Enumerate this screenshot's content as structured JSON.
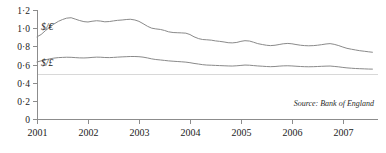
{
  "chart_data": {
    "type": "line",
    "title": "",
    "xlabel": "",
    "ylabel": "",
    "ylim": [
      0,
      1.2
    ],
    "xlim": [
      2001,
      2007.65
    ],
    "grid": "single horizontal gridline at 0.5",
    "legend_position": "inline labels at left of each series",
    "source": "Source: Bank of England",
    "y_ticks": [
      0,
      0.2,
      0.4,
      0.6,
      0.8,
      1.0,
      1.2
    ],
    "y_tick_labels": [
      "0",
      "0·2",
      "0·4",
      "0·6",
      "0·8",
      "1·0",
      "1·2"
    ],
    "x_ticks": [
      2001,
      2002,
      2003,
      2004,
      2005,
      2006,
      2007
    ],
    "x_tick_labels": [
      "2001",
      "2002",
      "2003",
      "2004",
      "2005",
      "2006",
      "2007"
    ],
    "gridlines_y": [
      0.5
    ],
    "series": [
      {
        "name": "$/€",
        "label": "$/€",
        "color": "#8a8a8a",
        "label_x": 2001.08,
        "label_y": 0.985,
        "x": [
          2001.0,
          2001.08,
          2001.17,
          2001.25,
          2001.33,
          2001.42,
          2001.5,
          2001.58,
          2001.67,
          2001.75,
          2001.83,
          2001.92,
          2002.0,
          2002.08,
          2002.17,
          2002.25,
          2002.33,
          2002.42,
          2002.5,
          2002.58,
          2002.67,
          2002.75,
          2002.83,
          2002.92,
          2003.0,
          2003.08,
          2003.17,
          2003.25,
          2003.33,
          2003.42,
          2003.5,
          2003.58,
          2003.67,
          2003.75,
          2003.83,
          2003.92,
          2004.0,
          2004.08,
          2004.17,
          2004.25,
          2004.33,
          2004.42,
          2004.5,
          2004.58,
          2004.67,
          2004.75,
          2004.83,
          2004.92,
          2005.0,
          2005.08,
          2005.17,
          2005.25,
          2005.33,
          2005.42,
          2005.5,
          2005.58,
          2005.67,
          2005.75,
          2005.83,
          2005.92,
          2006.0,
          2006.08,
          2006.17,
          2006.25,
          2006.33,
          2006.42,
          2006.5,
          2006.58,
          2006.67,
          2006.75,
          2006.83,
          2006.92,
          2007.0,
          2007.08,
          2007.17,
          2007.25,
          2007.33,
          2007.42,
          2007.5,
          2007.58
        ],
        "values": [
          0.905,
          0.93,
          0.975,
          1.01,
          1.045,
          1.075,
          1.095,
          1.11,
          1.115,
          1.1,
          1.085,
          1.072,
          1.068,
          1.076,
          1.082,
          1.078,
          1.07,
          1.073,
          1.08,
          1.086,
          1.09,
          1.095,
          1.098,
          1.09,
          1.075,
          1.05,
          1.02,
          1.0,
          0.992,
          0.986,
          0.975,
          0.96,
          0.952,
          0.95,
          0.948,
          0.945,
          0.93,
          0.905,
          0.885,
          0.875,
          0.872,
          0.868,
          0.86,
          0.855,
          0.848,
          0.84,
          0.838,
          0.843,
          0.855,
          0.862,
          0.858,
          0.845,
          0.83,
          0.82,
          0.812,
          0.808,
          0.812,
          0.82,
          0.828,
          0.832,
          0.828,
          0.82,
          0.812,
          0.808,
          0.806,
          0.808,
          0.812,
          0.818,
          0.826,
          0.83,
          0.822,
          0.808,
          0.792,
          0.778,
          0.768,
          0.76,
          0.752,
          0.746,
          0.74,
          0.735
        ]
      },
      {
        "name": "$/£",
        "label": "$/£",
        "color": "#8a8a8a",
        "label_x": 2001.08,
        "label_y": 0.585,
        "x": [
          2001.0,
          2001.08,
          2001.17,
          2001.25,
          2001.33,
          2001.42,
          2001.5,
          2001.58,
          2001.67,
          2001.75,
          2001.83,
          2001.92,
          2002.0,
          2002.08,
          2002.17,
          2002.25,
          2002.33,
          2002.42,
          2002.5,
          2002.58,
          2002.67,
          2002.75,
          2002.83,
          2002.92,
          2003.0,
          2003.08,
          2003.17,
          2003.25,
          2003.33,
          2003.42,
          2003.5,
          2003.58,
          2003.67,
          2003.75,
          2003.83,
          2003.92,
          2004.0,
          2004.08,
          2004.17,
          2004.25,
          2004.33,
          2004.42,
          2004.5,
          2004.58,
          2004.67,
          2004.75,
          2004.83,
          2004.92,
          2005.0,
          2005.08,
          2005.17,
          2005.25,
          2005.33,
          2005.42,
          2005.5,
          2005.58,
          2005.67,
          2005.75,
          2005.83,
          2005.92,
          2006.0,
          2006.08,
          2006.17,
          2006.25,
          2006.33,
          2006.42,
          2006.5,
          2006.58,
          2006.67,
          2006.75,
          2006.83,
          2006.92,
          2007.0,
          2007.08,
          2007.17,
          2007.25,
          2007.33,
          2007.42,
          2007.5,
          2007.58
        ],
        "values": [
          0.628,
          0.64,
          0.652,
          0.662,
          0.67,
          0.676,
          0.678,
          0.68,
          0.679,
          0.676,
          0.673,
          0.672,
          0.674,
          0.678,
          0.681,
          0.68,
          0.677,
          0.676,
          0.678,
          0.681,
          0.684,
          0.686,
          0.688,
          0.688,
          0.686,
          0.681,
          0.672,
          0.662,
          0.655,
          0.65,
          0.645,
          0.64,
          0.636,
          0.633,
          0.63,
          0.626,
          0.62,
          0.612,
          0.605,
          0.598,
          0.594,
          0.592,
          0.59,
          0.588,
          0.586,
          0.584,
          0.583,
          0.586,
          0.59,
          0.594,
          0.592,
          0.588,
          0.584,
          0.581,
          0.578,
          0.576,
          0.578,
          0.582,
          0.585,
          0.586,
          0.584,
          0.581,
          0.578,
          0.576,
          0.575,
          0.576,
          0.578,
          0.58,
          0.582,
          0.583,
          0.579,
          0.574,
          0.568,
          0.563,
          0.559,
          0.556,
          0.554,
          0.552,
          0.55,
          0.549
        ]
      }
    ]
  },
  "layout": {
    "plot_left": 37,
    "plot_right": 376,
    "plot_top": 10,
    "plot_bottom": 119,
    "px_per_year": 50.9
  }
}
